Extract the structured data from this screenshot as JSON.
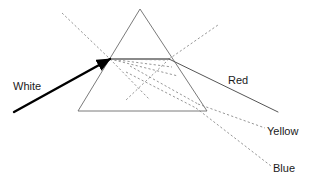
{
  "diagram": {
    "type": "optics-ray-diagram",
    "canvas": {
      "width": 314,
      "height": 185,
      "background": "#ffffff"
    },
    "colors": {
      "prism_outline": "#6b6b6b",
      "internal_surface_line": "#8a8a8a",
      "incident_ray": "#000000",
      "exit_ray": "#555555",
      "dashed_ray": "#8a8a8a",
      "label_text": "#1a1a1a"
    },
    "prism": {
      "name": "triangular-prism",
      "apex": {
        "x": 140,
        "y": 9
      },
      "bottom_left": {
        "x": 78,
        "y": 111
      },
      "bottom_right": {
        "x": 207,
        "y": 111
      },
      "stroke_width": 0.9
    },
    "internal_surface": {
      "name": "internal-reflecting-surface",
      "from": {
        "x": 110,
        "y": 59
      },
      "to": {
        "x": 169,
        "y": 59
      },
      "stroke_width": 2
    },
    "entry_point": {
      "x": 110,
      "y": 59
    },
    "exit_point": {
      "x": 169,
      "y": 59
    },
    "rays": [
      {
        "id": "white-incident-ray",
        "label": "White",
        "style": "solid",
        "thick": true,
        "arrow": true,
        "points": [
          {
            "x": 14,
            "y": 112
          },
          {
            "x": 110,
            "y": 59
          }
        ]
      },
      {
        "id": "red-exit-ray",
        "label": "Red",
        "style": "solid",
        "thick": false,
        "arrow": false,
        "points": [
          {
            "x": 169,
            "y": 59
          },
          {
            "x": 278,
            "y": 112
          }
        ]
      },
      {
        "id": "yellow-exit-ray",
        "label": "Yellow",
        "style": "dashed",
        "thick": false,
        "arrow": false,
        "points": [
          {
            "x": 198,
            "y": 104
          },
          {
            "x": 265,
            "y": 128
          }
        ]
      },
      {
        "id": "blue-exit-ray",
        "label": "Blue",
        "style": "dashed",
        "thick": false,
        "arrow": false,
        "points": [
          {
            "x": 196,
            "y": 108
          },
          {
            "x": 271,
            "y": 166
          }
        ]
      }
    ],
    "construction_lines": [
      {
        "id": "upper-left-dashed-extension",
        "style": "dashed",
        "points": [
          {
            "x": 62,
            "y": 13
          },
          {
            "x": 110,
            "y": 59
          }
        ]
      },
      {
        "id": "upper-right-dashed-extension",
        "style": "dashed",
        "points": [
          {
            "x": 169,
            "y": 59
          },
          {
            "x": 218,
            "y": 25
          }
        ]
      },
      {
        "id": "internal-dashed-ray-1",
        "style": "dashed",
        "points": [
          {
            "x": 110,
            "y": 59
          },
          {
            "x": 168,
            "y": 60
          }
        ]
      },
      {
        "id": "internal-dashed-ray-2",
        "style": "dashed",
        "points": [
          {
            "x": 110,
            "y": 59
          },
          {
            "x": 172,
            "y": 67
          }
        ]
      },
      {
        "id": "internal-dashed-ray-3",
        "style": "dashed",
        "points": [
          {
            "x": 110,
            "y": 59
          },
          {
            "x": 178,
            "y": 76
          }
        ]
      },
      {
        "id": "internal-dashed-ray-4",
        "style": "dashed",
        "points": [
          {
            "x": 110,
            "y": 59
          },
          {
            "x": 150,
            "y": 100
          }
        ]
      },
      {
        "id": "internal-dashed-crossing-ray",
        "style": "dashed",
        "points": [
          {
            "x": 166,
            "y": 62
          },
          {
            "x": 126,
            "y": 100
          }
        ]
      },
      {
        "id": "internal-dashed-to-corner-1",
        "style": "dashed",
        "points": [
          {
            "x": 130,
            "y": 66
          },
          {
            "x": 198,
            "y": 104
          }
        ]
      },
      {
        "id": "internal-dashed-to-corner-2",
        "style": "dashed",
        "points": [
          {
            "x": 126,
            "y": 72
          },
          {
            "x": 196,
            "y": 108
          }
        ]
      }
    ],
    "labels": [
      {
        "id": "label-white",
        "text": "White",
        "x": 13,
        "y": 90,
        "anchor": "start"
      },
      {
        "id": "label-red",
        "text": "Red",
        "x": 228,
        "y": 84,
        "anchor": "start"
      },
      {
        "id": "label-yellow",
        "text": "Yellow",
        "x": 267,
        "y": 135,
        "anchor": "start"
      },
      {
        "id": "label-blue",
        "text": "Blue",
        "x": 273,
        "y": 172,
        "anchor": "start"
      }
    ]
  }
}
